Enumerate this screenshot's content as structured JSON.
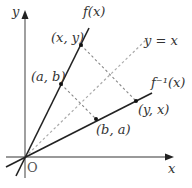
{
  "diagram": {
    "axes": {
      "x_label": "x",
      "y_label": "y",
      "origin_label": "O"
    },
    "curves": [
      {
        "id": "f",
        "label": "f(x)",
        "style": "solid",
        "color": "#222222"
      },
      {
        "id": "f_inverse",
        "label": "f⁻¹(x)",
        "style": "solid",
        "color": "#222222"
      },
      {
        "id": "identity",
        "label": "y = x",
        "style": "dashed",
        "color": "#aaaaaa"
      }
    ],
    "points": [
      {
        "id": "xy",
        "label": "(x, y)",
        "on": "f"
      },
      {
        "id": "ab",
        "label": "(a, b)",
        "on": "f"
      },
      {
        "id": "ba",
        "label": "(b, a)",
        "on": "f_inverse"
      },
      {
        "id": "yx",
        "label": "(y, x)",
        "on": "f_inverse"
      }
    ],
    "connectors": [
      {
        "from": "(x, y)",
        "to": "(y, x)",
        "style": "dashed"
      },
      {
        "from": "(a, b)",
        "to": "(b, a)",
        "style": "dashed"
      }
    ],
    "colors": {
      "axis": "#666666",
      "curve": "#222222",
      "dashed": "#999999"
    }
  }
}
